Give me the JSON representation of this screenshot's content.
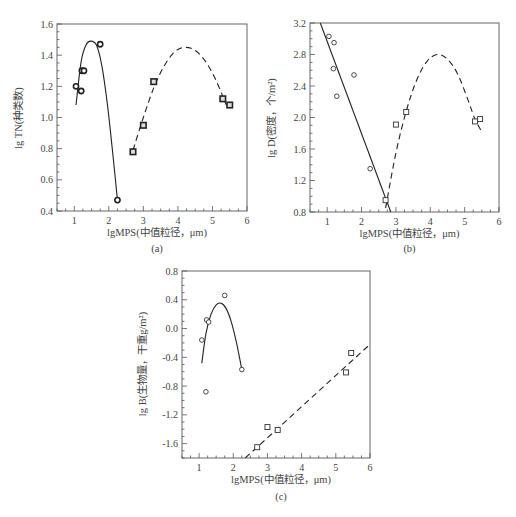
{
  "chart_data": [
    {
      "id": "a",
      "type": "scatter",
      "panel_label": "(a)",
      "title": "",
      "xlabel": "lgMPS(中值粒径，μm)",
      "ylabel": "lg TN(种类数)",
      "xlim": [
        0.5,
        6
      ],
      "ylim": [
        0.4,
        1.6
      ],
      "xticks": [
        1,
        2,
        3,
        4,
        5,
        6
      ],
      "yticks": [
        0.4,
        0.6,
        0.8,
        1.0,
        1.2,
        1.4,
        1.6
      ],
      "ytick_labels": [
        "0.4",
        "0.6",
        "0.8",
        "1.0",
        "1.2",
        "1.4",
        "1.6"
      ],
      "grid": false,
      "marker_style": "filled",
      "series": [
        {
          "name": "group1",
          "marker": "circle",
          "x": [
            1.05,
            1.2,
            1.22,
            1.28,
            1.75,
            2.25
          ],
          "y": [
            1.2,
            1.17,
            1.3,
            1.3,
            1.47,
            0.47
          ]
        },
        {
          "name": "group2",
          "marker": "square",
          "x": [
            2.7,
            3.0,
            3.3,
            5.3,
            5.5
          ],
          "y": [
            0.78,
            0.95,
            1.23,
            1.12,
            1.08
          ]
        }
      ],
      "fits": [
        {
          "style": "solid",
          "type": "quadratic",
          "x": [
            1.05,
            1.2,
            1.35,
            1.5,
            1.65,
            1.8,
            1.95,
            2.1,
            2.25
          ],
          "y": [
            1.08,
            1.36,
            1.47,
            1.49,
            1.46,
            1.33,
            1.1,
            0.8,
            0.47
          ]
        },
        {
          "style": "dashed",
          "type": "quadratic",
          "x": [
            2.7,
            3.0,
            3.3,
            3.6,
            3.9,
            4.2,
            4.5,
            4.8,
            5.1,
            5.4
          ],
          "y": [
            0.79,
            1.0,
            1.19,
            1.33,
            1.42,
            1.45,
            1.43,
            1.36,
            1.24,
            1.08
          ]
        }
      ]
    },
    {
      "id": "b",
      "type": "scatter",
      "panel_label": "(b)",
      "title": "",
      "xlabel": "lgMPS(中值粒径，μm)",
      "ylabel": "lg D(密度，个/m²)",
      "xlim": [
        0.5,
        6
      ],
      "ylim": [
        0.8,
        3.2
      ],
      "xticks": [
        1,
        2,
        3,
        4,
        5,
        6
      ],
      "yticks": [
        0.8,
        1.2,
        1.6,
        2.0,
        2.4,
        2.8,
        3.2
      ],
      "ytick_labels": [
        "0.8",
        "1.2",
        "1.6",
        "2.0",
        "2.4",
        "2.8",
        "3.2"
      ],
      "grid": false,
      "marker_style": "open",
      "series": [
        {
          "name": "group1",
          "marker": "circle",
          "x": [
            1.05,
            1.2,
            1.18,
            1.28,
            1.78,
            2.25
          ],
          "y": [
            3.03,
            2.95,
            2.62,
            2.27,
            2.54,
            1.35
          ]
        },
        {
          "name": "group2",
          "marker": "square",
          "x": [
            2.7,
            3.0,
            3.3,
            5.3,
            5.45
          ],
          "y": [
            0.95,
            1.91,
            2.07,
            1.95,
            1.98
          ]
        }
      ],
      "fits": [
        {
          "style": "solid",
          "type": "linear",
          "x": [
            0.8,
            2.85
          ],
          "y": [
            3.2,
            0.8
          ]
        },
        {
          "style": "dashed",
          "type": "quadratic",
          "x": [
            2.7,
            3.0,
            3.3,
            3.6,
            3.9,
            4.2,
            4.5,
            4.8,
            5.1,
            5.3,
            5.5
          ],
          "y": [
            0.85,
            1.55,
            2.08,
            2.47,
            2.71,
            2.8,
            2.74,
            2.55,
            2.22,
            1.98,
            1.82
          ]
        }
      ]
    },
    {
      "id": "c",
      "type": "scatter",
      "panel_label": "(c)",
      "title": "",
      "xlabel": "lgMPS(中值粒径，μm)",
      "ylabel": "lg B(生物量，干重g/m²)",
      "xlim": [
        0.5,
        6
      ],
      "ylim": [
        -1.8,
        0.8
      ],
      "xticks": [
        1,
        2,
        3,
        4,
        5,
        6
      ],
      "yticks": [
        -1.6,
        -1.2,
        -0.8,
        -0.4,
        0.0,
        0.4,
        0.8
      ],
      "ytick_labels": [
        "-1.6",
        "-1.2",
        "-0.8",
        "-0.4",
        "0.0",
        "0.4",
        "0.8"
      ],
      "grid": false,
      "marker_style": "open",
      "series": [
        {
          "name": "group1",
          "marker": "circle",
          "x": [
            1.08,
            1.22,
            1.28,
            1.75,
            2.25,
            1.2
          ],
          "y": [
            -0.16,
            0.12,
            0.09,
            0.46,
            -0.57,
            -0.88
          ]
        },
        {
          "name": "group2",
          "marker": "square",
          "x": [
            2.7,
            3.0,
            3.3,
            5.3,
            5.45
          ],
          "y": [
            -1.65,
            -1.37,
            -1.41,
            -0.61,
            -0.34
          ]
        }
      ],
      "fits": [
        {
          "style": "solid",
          "type": "quadratic",
          "x": [
            1.08,
            1.2,
            1.35,
            1.5,
            1.65,
            1.8,
            1.95,
            2.1,
            2.25
          ],
          "y": [
            -0.48,
            -0.07,
            0.2,
            0.33,
            0.35,
            0.27,
            0.08,
            -0.21,
            -0.57
          ]
        },
        {
          "style": "dashed",
          "type": "linear",
          "x": [
            2.35,
            6.0
          ],
          "y": [
            -1.8,
            -0.22
          ]
        }
      ]
    }
  ]
}
